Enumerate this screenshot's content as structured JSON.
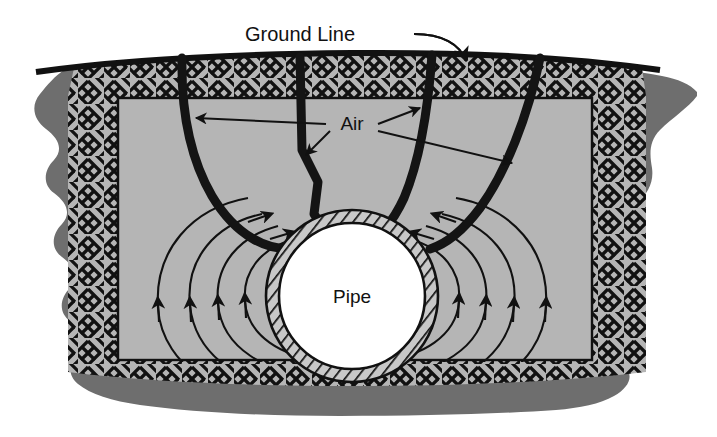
{
  "figure": {
    "width": 717,
    "height": 437,
    "background_color": "#ffffff"
  },
  "colors": {
    "outer_soil_gray": "#6e6e6e",
    "trench_fill_gray": "#b5b5b5",
    "hatch_black": "#111111",
    "pipe_interior_white": "#ffffff",
    "line_black": "#111111",
    "air_channel_black": "#141414"
  },
  "labels": {
    "ground_line": "Ground Line",
    "air": "Air",
    "pipe": "Pipe"
  },
  "annotations": {
    "ground_line_leader": {
      "text_anchor_x": 300,
      "text_anchor_y": 40,
      "arrow_tip_x": 466,
      "arrow_tip_y": 63
    },
    "air_leaders": [
      {
        "target": "channel-1",
        "tip_x": 196,
        "tip_y": 118
      },
      {
        "target": "channel-2",
        "tip_x": 306,
        "tip_y": 155
      },
      {
        "target": "channel-3",
        "tip_x": 420,
        "tip_y": 108
      },
      {
        "target": "channel-4",
        "tip_x": 512,
        "tip_y": 163
      }
    ]
  },
  "pipe": {
    "center_x": 352,
    "center_y": 296,
    "outer_radius": 86,
    "inner_radius": 73,
    "wall_pattern": "diagonal-hatch",
    "interior_label": "Pipe"
  },
  "trench": {
    "top_y": 66,
    "bottom_y": 392,
    "left_x": 86,
    "right_x": 622,
    "border_pattern": "herringbone-hatch",
    "border_thickness": 34
  },
  "air_channels": [
    {
      "name": "channel-1",
      "top_x": 182,
      "description": "curves down-right to pipe crown"
    },
    {
      "name": "channel-2",
      "top_x": 300,
      "description": "near vertical with slight zigzag"
    },
    {
      "name": "channel-3",
      "top_x": 432,
      "description": "slopes down-left to pipe crown"
    },
    {
      "name": "channel-4",
      "top_x": 540,
      "description": "slopes down-left to pipe right shoulder"
    }
  ],
  "flow_lines": {
    "description": "Concentric arcs of seepage flow around the buried pipe",
    "arrow_direction": "upward toward pipe crown",
    "count_per_side": 4
  }
}
